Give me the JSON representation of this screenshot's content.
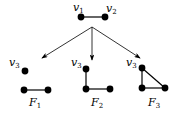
{
  "diagram": {
    "root": {
      "v1": "v",
      "v1_sub": "1",
      "v2": "v",
      "v2_sub": "2"
    },
    "graphs": [
      {
        "name": "F",
        "sub": "1",
        "v3": "v",
        "v3_sub": "3"
      },
      {
        "name": "F",
        "sub": "2",
        "v3": "v",
        "v3_sub": "3"
      },
      {
        "name": "F",
        "sub": "3",
        "v3": "v",
        "v3_sub": "3"
      }
    ]
  }
}
